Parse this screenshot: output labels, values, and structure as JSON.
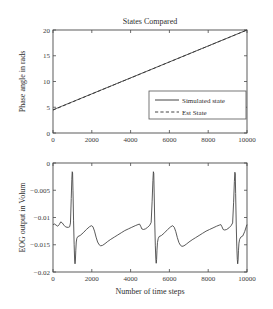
{
  "figure": {
    "background_color": "#ffffff",
    "line_color": "#3c3c3c"
  },
  "chart_data": [
    {
      "type": "line",
      "id": "states-compared",
      "title": "States Compared",
      "xlabel": "",
      "ylabel": "Phase angle in rads",
      "xlim": [
        0,
        10000
      ],
      "ylim": [
        0,
        20
      ],
      "xticks": [
        0,
        2000,
        4000,
        6000,
        8000,
        10000
      ],
      "xticklabels": [
        "0",
        "2000",
        "4000",
        "6000",
        "8000",
        "10000"
      ],
      "yticks": [
        0,
        5,
        10,
        15,
        20
      ],
      "yticklabels": [
        "0",
        "5",
        "10",
        "15",
        "20"
      ],
      "grid": false,
      "legend_position": "lower right",
      "x": [
        0,
        500,
        1000,
        1500,
        2000,
        2500,
        3000,
        3500,
        4000,
        4500,
        5000,
        5500,
        6000,
        6500,
        7000,
        7500,
        8000,
        8500,
        9000,
        9500,
        10000
      ],
      "series": [
        {
          "name": "Simulated state",
          "style": "solid",
          "values": [
            4.5,
            5.28,
            6.05,
            6.83,
            7.6,
            8.38,
            9.15,
            9.93,
            10.7,
            11.48,
            12.25,
            13.03,
            13.8,
            14.58,
            15.35,
            16.13,
            16.9,
            17.68,
            18.45,
            19.23,
            20.0
          ]
        },
        {
          "name": "Est State",
          "style": "dashed",
          "values": [
            4.45,
            5.24,
            6.02,
            6.8,
            7.58,
            8.36,
            9.13,
            9.91,
            10.68,
            11.46,
            12.24,
            13.01,
            13.79,
            14.56,
            15.34,
            16.12,
            16.89,
            17.67,
            18.44,
            19.22,
            19.98
          ]
        }
      ]
    },
    {
      "type": "line",
      "id": "eog-output",
      "title": "",
      "xlabel": "Number of time steps",
      "ylabel": "EOG output in Volum",
      "xlim": [
        0,
        10000
      ],
      "ylim": [
        -0.02,
        0
      ],
      "xticks": [
        0,
        2000,
        4000,
        6000,
        8000,
        10000
      ],
      "xticklabels": [
        "0",
        "2000",
        "4000",
        "6000",
        "8000",
        "10000"
      ],
      "yticks": [
        -0.02,
        -0.015,
        -0.01,
        -0.005,
        0
      ],
      "yticklabels": [
        "−0.02",
        "−0.015",
        "−0.01",
        "−0.005",
        "0"
      ],
      "grid": false,
      "legend_position": "none",
      "series": [
        {
          "name": "EOG output",
          "style": "solid",
          "points": [
            [
              0,
              -0.0113
            ],
            [
              80,
              -0.0112
            ],
            [
              160,
              -0.0114
            ],
            [
              240,
              -0.0116
            ],
            [
              320,
              -0.0113
            ],
            [
              400,
              -0.0108
            ],
            [
              480,
              -0.011
            ],
            [
              560,
              -0.0114
            ],
            [
              640,
              -0.0117
            ],
            [
              720,
              -0.0118
            ],
            [
              800,
              -0.0118
            ],
            [
              860,
              -0.0117
            ],
            [
              900,
              -0.011
            ],
            [
              940,
              -0.0065
            ],
            [
              970,
              -0.003
            ],
            [
              990,
              -0.0016
            ],
            [
              1010,
              -0.0018
            ],
            [
              1030,
              -0.005
            ],
            [
              1060,
              -0.0105
            ],
            [
              1090,
              -0.015
            ],
            [
              1115,
              -0.0178
            ],
            [
              1135,
              -0.0185
            ],
            [
              1155,
              -0.0178
            ],
            [
              1175,
              -0.016
            ],
            [
              1200,
              -0.0145
            ],
            [
              1230,
              -0.0138
            ],
            [
              1280,
              -0.0135
            ],
            [
              1400,
              -0.0133
            ],
            [
              1560,
              -0.0128
            ],
            [
              1720,
              -0.0122
            ],
            [
              1880,
              -0.0117
            ],
            [
              1980,
              -0.0115
            ],
            [
              2060,
              -0.0117
            ],
            [
              2140,
              -0.0125
            ],
            [
              2220,
              -0.0136
            ],
            [
              2300,
              -0.0145
            ],
            [
              2380,
              -0.015
            ],
            [
              2460,
              -0.0152
            ],
            [
              2560,
              -0.0151
            ],
            [
              2680,
              -0.0148
            ],
            [
              2820,
              -0.0144
            ],
            [
              2980,
              -0.014
            ],
            [
              3160,
              -0.0136
            ],
            [
              3340,
              -0.0132
            ],
            [
              3520,
              -0.0128
            ],
            [
              3700,
              -0.0124
            ],
            [
              3880,
              -0.0121
            ],
            [
              4060,
              -0.0118
            ],
            [
              4240,
              -0.0115
            ],
            [
              4380,
              -0.0113
            ],
            [
              4460,
              -0.0112
            ],
            [
              4520,
              -0.0116
            ],
            [
              4580,
              -0.0121
            ],
            [
              4660,
              -0.0122
            ],
            [
              4760,
              -0.0121
            ],
            [
              4880,
              -0.0118
            ],
            [
              4990,
              -0.0114
            ],
            [
              5060,
              -0.0109
            ],
            [
              5110,
              -0.007
            ],
            [
              5150,
              -0.0032
            ],
            [
              5175,
              -0.0016
            ],
            [
              5195,
              -0.0019
            ],
            [
              5215,
              -0.0055
            ],
            [
              5245,
              -0.011
            ],
            [
              5275,
              -0.0152
            ],
            [
              5300,
              -0.0176
            ],
            [
              5320,
              -0.0184
            ],
            [
              5340,
              -0.0177
            ],
            [
              5360,
              -0.016
            ],
            [
              5385,
              -0.0146
            ],
            [
              5420,
              -0.0139
            ],
            [
              5470,
              -0.0135
            ],
            [
              5590,
              -0.0133
            ],
            [
              5750,
              -0.0128
            ],
            [
              5910,
              -0.0122
            ],
            [
              6070,
              -0.0117
            ],
            [
              6170,
              -0.0115
            ],
            [
              6250,
              -0.0118
            ],
            [
              6330,
              -0.0126
            ],
            [
              6410,
              -0.0137
            ],
            [
              6490,
              -0.0146
            ],
            [
              6570,
              -0.0151
            ],
            [
              6650,
              -0.0153
            ],
            [
              6750,
              -0.0152
            ],
            [
              6870,
              -0.0149
            ],
            [
              7010,
              -0.0145
            ],
            [
              7170,
              -0.0141
            ],
            [
              7350,
              -0.0137
            ],
            [
              7530,
              -0.0133
            ],
            [
              7710,
              -0.0129
            ],
            [
              7890,
              -0.0125
            ],
            [
              8070,
              -0.0122
            ],
            [
              8250,
              -0.0119
            ],
            [
              8430,
              -0.0116
            ],
            [
              8570,
              -0.0114
            ],
            [
              8650,
              -0.0113
            ],
            [
              8710,
              -0.0117
            ],
            [
              8770,
              -0.0122
            ],
            [
              8850,
              -0.0123
            ],
            [
              8950,
              -0.0122
            ],
            [
              9070,
              -0.0119
            ],
            [
              9180,
              -0.0115
            ],
            [
              9260,
              -0.011
            ],
            [
              9310,
              -0.0072
            ],
            [
              9350,
              -0.0034
            ],
            [
              9375,
              -0.0017
            ],
            [
              9395,
              -0.002
            ],
            [
              9415,
              -0.0056
            ],
            [
              9445,
              -0.0112
            ],
            [
              9475,
              -0.0154
            ],
            [
              9500,
              -0.0177
            ],
            [
              9520,
              -0.0185
            ],
            [
              9540,
              -0.0178
            ],
            [
              9560,
              -0.0161
            ],
            [
              9585,
              -0.0147
            ],
            [
              9620,
              -0.014
            ],
            [
              9680,
              -0.0136
            ],
            [
              9780,
              -0.0134
            ],
            [
              9880,
              -0.0126
            ],
            [
              9960,
              -0.0117
            ],
            [
              10000,
              -0.0113
            ]
          ]
        }
      ]
    }
  ]
}
